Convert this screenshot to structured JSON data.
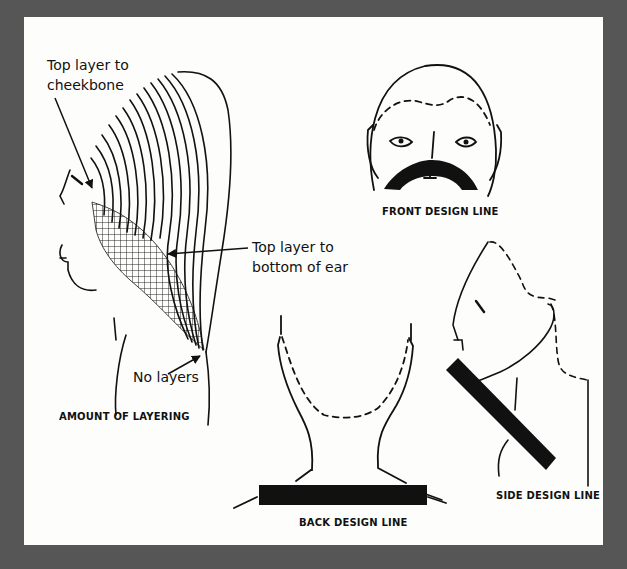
{
  "figure": {
    "panels": [
      {
        "id": "amount-of-layering",
        "caption": "AMOUNT OF LAYERING",
        "callouts": [
          {
            "line1": "Top layer to",
            "line2": "cheekbone"
          },
          {
            "line1": "Top layer to",
            "line2": "bottom of ear"
          },
          {
            "line1": "No layers"
          }
        ]
      },
      {
        "id": "front-design-line",
        "caption": "FRONT DESIGN LINE"
      },
      {
        "id": "back-design-line",
        "caption": "BACK DESIGN LINE"
      },
      {
        "id": "side-design-line",
        "caption": "SIDE DESIGN LINE"
      }
    ]
  },
  "colors": {
    "background": "#565656",
    "panel": "#fdfdfb",
    "ink": "#111111"
  }
}
